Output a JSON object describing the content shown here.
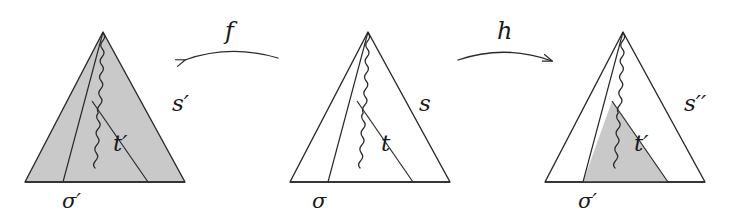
{
  "figure": {
    "kind": "mathematical-diagram",
    "background_color": "#ffffff",
    "stroke_color": "#2a2a2a",
    "shade_color": "#c9c9c9"
  },
  "panels": [
    {
      "id": "left",
      "side_label": "s′",
      "inner_label": "t′",
      "base_label": "σ′",
      "shaded": "whole-triangle"
    },
    {
      "id": "middle",
      "side_label": "s",
      "inner_label": "t",
      "base_label": "σ",
      "shaded": "none"
    },
    {
      "id": "right",
      "side_label": "s′′",
      "inner_label": "t′",
      "base_label": "σ′",
      "shaded": "inner-triangle"
    }
  ],
  "arrows": [
    {
      "id": "f",
      "label": "f",
      "direction": "left",
      "from": "middle",
      "to": "left"
    },
    {
      "id": "h",
      "label": "h",
      "direction": "right",
      "from": "middle",
      "to": "right"
    }
  ],
  "labels": {
    "left_side": "s′",
    "left_inner": "t′",
    "left_base": "σ′",
    "middle_side": "s",
    "middle_inner": "t",
    "middle_base": "σ",
    "right_side": "s′′",
    "right_inner": "t′",
    "right_base": "σ′",
    "arrow_f": "f",
    "arrow_h": "h"
  }
}
